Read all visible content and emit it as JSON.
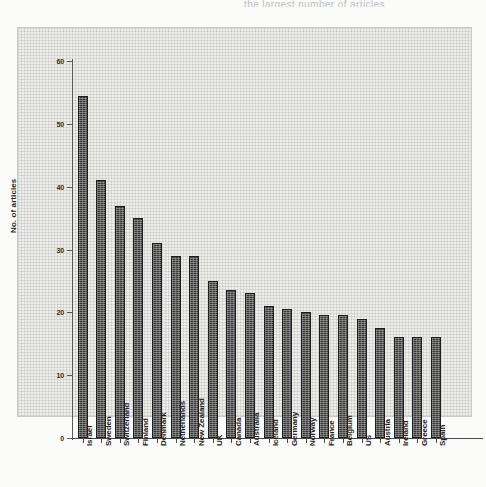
{
  "page": {
    "top_cropped_text": "the largest number of articles"
  },
  "chart_data": {
    "type": "bar",
    "title": "",
    "subtitle": "",
    "xlabel": "",
    "ylabel": "No. of articles",
    "ylim": [
      0,
      60
    ],
    "yticks": [
      0,
      10,
      20,
      30,
      40,
      50,
      60
    ],
    "ytick_labels": [
      "0",
      "10",
      "20",
      "30",
      "40",
      "50",
      "60"
    ],
    "grid": false,
    "legend": false,
    "legend_position": "none",
    "orientation": "vertical",
    "bar_color": "#333333",
    "categories": [
      "Israel",
      "Sweden",
      "Switzerland",
      "Finland",
      "Denmark",
      "Netherlands",
      "New Zealand",
      "UK",
      "Canada",
      "Australia",
      "Iceland",
      "Germany",
      "Norway",
      "France",
      "Belgium",
      "US",
      "Austria",
      "Ireland",
      "Greece",
      "Spain"
    ],
    "values": [
      54.5,
      41,
      37,
      35,
      31,
      29,
      29,
      25,
      23.5,
      23,
      21,
      20.5,
      20,
      19.5,
      19.5,
      19,
      17.5,
      16,
      16,
      16
    ]
  }
}
